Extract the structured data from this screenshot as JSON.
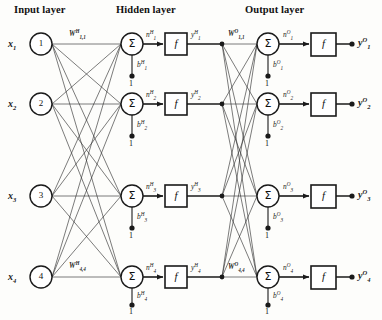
{
  "figure": {
    "kind": "neural-network-architecture-diagram",
    "background_color": "#fdfdfb",
    "ink_color": "#1a1a1a"
  },
  "titles": {
    "input": "Input layer",
    "hidden": "Hidden layer",
    "output": "Output layer"
  },
  "input_layer": {
    "nodes": [
      {
        "number": "1",
        "label_html": "x",
        "label_sub": "1"
      },
      {
        "number": "2",
        "label_html": "x",
        "label_sub": "2"
      },
      {
        "number": "3",
        "label_html": "x",
        "label_sub": "3"
      },
      {
        "number": "4",
        "label_html": "x",
        "label_sub": "4"
      }
    ],
    "x_labels": [
      "x₁",
      "x₂",
      "x₃",
      "x₄"
    ]
  },
  "hidden_layer": {
    "sum_glyph": "Σ",
    "activation_glyph": "f",
    "weight_first": "W",
    "weight_first_sup": "H",
    "weight_first_sub": "1,1",
    "weight_last": "W",
    "weight_last_sup": "H",
    "weight_last_sub": "4,4",
    "net_symbol": "n",
    "net_sup": "H",
    "net_subs": [
      "1",
      "2",
      "3",
      "4"
    ],
    "bias_symbol": "b",
    "bias_sup": "H",
    "bias_subs": [
      "1",
      "2",
      "3",
      "4"
    ],
    "bias_source": "1",
    "out_symbol": "y",
    "out_sup": "H",
    "out_subs": [
      "1",
      "2",
      "3",
      "4"
    ]
  },
  "output_layer": {
    "sum_glyph": "Σ",
    "activation_glyph": "f",
    "weight_first": "W",
    "weight_first_sup": "O",
    "weight_first_sub": "1,1",
    "weight_last": "W",
    "weight_last_sup": "O",
    "weight_last_sub": "4,4",
    "net_symbol": "n",
    "net_sup": "O",
    "net_subs": [
      "1",
      "2",
      "3",
      "4"
    ],
    "bias_symbol": "b",
    "bias_sup": "O",
    "bias_subs": [
      "1",
      "2",
      "3",
      "4"
    ],
    "bias_source": "1",
    "out_symbol": "y",
    "out_sup": "O",
    "out_subs": [
      "1",
      "2",
      "3",
      "4"
    ]
  },
  "geometry": {
    "rows_y": [
      44,
      104,
      196,
      277
    ],
    "input_node_cx": 41,
    "hidden_sum_cx": 132,
    "hidden_f_x": 165,
    "output_sum_cx": 268,
    "output_f_x": 311
  }
}
